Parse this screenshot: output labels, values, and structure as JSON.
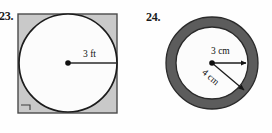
{
  "page": {
    "width": 272,
    "height": 133,
    "background": "#fefefe"
  },
  "problems": [
    {
      "number": "23.",
      "figure": "circle-inscribed-in-square",
      "shape_colors": {
        "square_fill": "#c9c9c9",
        "square_stroke": "#4a4a4a",
        "circle_fill": "#fcfcfc",
        "circle_stroke": "#1c1c1c",
        "dot": "#101010",
        "radius_line": "#2b2b2b"
      },
      "labels": [
        {
          "text": "3 ft",
          "measure": "radius",
          "value": 3,
          "unit": "ft"
        }
      ],
      "marks": [
        {
          "type": "right-angle-mark",
          "position": "bottom-left-corner"
        }
      ],
      "geometry": {
        "square": {
          "x": 18,
          "y": 14,
          "size": 99
        },
        "circle": {
          "cx": 68,
          "cy": 63,
          "r": 49
        },
        "center_dot": {
          "cx": 68,
          "cy": 63,
          "r": 2.6
        },
        "radius_line": {
          "x1": 68,
          "y1": 63,
          "x2": 117,
          "y2": 63
        }
      }
    },
    {
      "number": "24.",
      "figure": "annulus-ring",
      "shape_colors": {
        "ring_fill": "#5c5c5c",
        "ring_stroke": "#2a2a2a",
        "inner_fill": "#fcfcfc",
        "dot": "#101010",
        "arrow_line": "#1c1c1c"
      },
      "labels": [
        {
          "text": "3 cm",
          "measure": "inner-radius",
          "value": 3,
          "unit": "cm"
        },
        {
          "text": "4 cm",
          "measure": "outer-radius",
          "value": 4,
          "unit": "cm"
        }
      ],
      "geometry": {
        "center": {
          "cx": 76,
          "cy": 63
        },
        "outer_radius": 46,
        "inner_radius": 36,
        "center_dot_r": 2.6,
        "inner_arrow": {
          "x1": 76,
          "y1": 63,
          "x2": 112,
          "y2": 63,
          "angle_deg": 0
        },
        "outer_arrow": {
          "x1": 76,
          "y1": 63,
          "x2": 111,
          "y2": 93,
          "angle_deg": 40
        }
      }
    }
  ]
}
